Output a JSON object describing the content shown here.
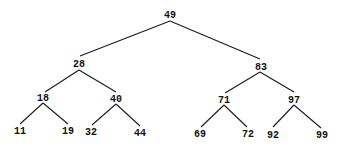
{
  "diagram": {
    "type": "binary-search-tree",
    "colors": {
      "edge": "#1a1a1a",
      "text": "#111111",
      "background": "#ffffff"
    },
    "nodes": [
      {
        "id": "n49",
        "label": "49",
        "x": 170,
        "y": 18
      },
      {
        "id": "n28",
        "label": "28",
        "x": 79,
        "y": 67
      },
      {
        "id": "n83",
        "label": "83",
        "x": 261,
        "y": 70
      },
      {
        "id": "n18",
        "label": "18",
        "x": 43,
        "y": 101
      },
      {
        "id": "n40",
        "label": "40",
        "x": 116,
        "y": 102
      },
      {
        "id": "n71",
        "label": "71",
        "x": 224,
        "y": 103
      },
      {
        "id": "n97",
        "label": "97",
        "x": 294,
        "y": 103
      },
      {
        "id": "n11",
        "label": "11",
        "x": 20,
        "y": 134
      },
      {
        "id": "n19",
        "label": "19",
        "x": 68,
        "y": 134
      },
      {
        "id": "n32",
        "label": "32",
        "x": 91,
        "y": 135
      },
      {
        "id": "n44",
        "label": "44",
        "x": 140,
        "y": 136
      },
      {
        "id": "n69",
        "label": "69",
        "x": 200,
        "y": 137
      },
      {
        "id": "n72",
        "label": "72",
        "x": 248,
        "y": 137
      },
      {
        "id": "n92",
        "label": "92",
        "x": 273,
        "y": 138
      },
      {
        "id": "n99",
        "label": "99",
        "x": 322,
        "y": 138
      }
    ],
    "edges": [
      {
        "from": "49",
        "to": "28",
        "x1": 170,
        "y1": 21,
        "x2": 80,
        "y2": 56
      },
      {
        "from": "49",
        "to": "83",
        "x1": 170,
        "y1": 21,
        "x2": 260,
        "y2": 59
      },
      {
        "from": "28",
        "to": "18",
        "x1": 79,
        "y1": 70,
        "x2": 45,
        "y2": 92
      },
      {
        "from": "28",
        "to": "40",
        "x1": 79,
        "y1": 70,
        "x2": 116,
        "y2": 92
      },
      {
        "from": "18",
        "to": "11",
        "x1": 43,
        "y1": 103,
        "x2": 20,
        "y2": 124
      },
      {
        "from": "18",
        "to": "19",
        "x1": 43,
        "y1": 103,
        "x2": 68,
        "y2": 124
      },
      {
        "from": "40",
        "to": "32",
        "x1": 116,
        "y1": 104,
        "x2": 92,
        "y2": 125
      },
      {
        "from": "40",
        "to": "44",
        "x1": 116,
        "y1": 104,
        "x2": 140,
        "y2": 126
      },
      {
        "from": "83",
        "to": "71",
        "x1": 260,
        "y1": 72,
        "x2": 225,
        "y2": 93
      },
      {
        "from": "83",
        "to": "97",
        "x1": 260,
        "y1": 72,
        "x2": 294,
        "y2": 92
      },
      {
        "from": "71",
        "to": "69",
        "x1": 224,
        "y1": 105,
        "x2": 201,
        "y2": 127
      },
      {
        "from": "71",
        "to": "72",
        "x1": 224,
        "y1": 105,
        "x2": 247,
        "y2": 127
      },
      {
        "from": "97",
        "to": "92",
        "x1": 294,
        "y1": 105,
        "x2": 273,
        "y2": 127
      },
      {
        "from": "97",
        "to": "99",
        "x1": 294,
        "y1": 105,
        "x2": 321,
        "y2": 128
      }
    ]
  }
}
